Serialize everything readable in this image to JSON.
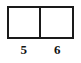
{
  "figure": {
    "name": "two-cell-box-diagram",
    "background_color": "#ffffff",
    "stroke_color": "#1a1a1a",
    "text_color": "#131313",
    "outline": {
      "x": 7,
      "y": 6,
      "width": 67,
      "height": 33,
      "border_width": 2
    },
    "divider": {
      "orientation": "vertical",
      "x": 40,
      "width": 2
    },
    "cells": [
      {
        "id": "left-cell",
        "label": "5",
        "fill": "#ffffff"
      },
      {
        "id": "right-cell",
        "label": "6",
        "fill": "#ffffff"
      }
    ]
  },
  "chart_data": {
    "type": "table",
    "title": "",
    "xlabel": "",
    "ylabel": "",
    "columns": [
      "5",
      "6"
    ],
    "rows": [
      [
        "",
        ""
      ]
    ],
    "categories": [
      "5",
      "6"
    ],
    "values": [
      5,
      6
    ],
    "grid": true,
    "legend": "none",
    "annotations": [
      "5",
      "6"
    ]
  }
}
